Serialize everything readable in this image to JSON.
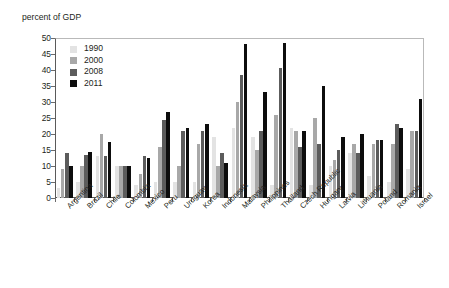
{
  "figure": {
    "title_clipped": "",
    "ylabel": "percent of GDP"
  },
  "legend": {
    "entries": [
      {
        "label": "1990",
        "color": "#e3e3e3"
      },
      {
        "label": "2000",
        "color": "#a8a8a8"
      },
      {
        "label": "2008",
        "color": "#5c5c5c"
      },
      {
        "label": "2011",
        "color": "#0d0d0d"
      }
    ]
  },
  "chart_data": {
    "type": "bar",
    "title": "",
    "xlabel": "",
    "ylabel": "percent of GDP",
    "ylim": [
      0,
      50
    ],
    "ytick_step": 5,
    "yticks": [
      "0",
      "5",
      "10",
      "15",
      "20",
      "25",
      "30",
      "35",
      "40",
      "45",
      "50"
    ],
    "grid": false,
    "legend_position": "top-left",
    "categories": [
      "Argentina",
      "Brazil",
      "Chile",
      "Colombia",
      "Mexico",
      "Peru",
      "Uruguay",
      "Korea",
      "Indonesia",
      "Malaysia",
      "Philippines",
      "Thailand",
      "Czech Republic",
      "Hungary",
      "Latvia",
      "Lithuania",
      "Poland",
      "Romania",
      "Israel"
    ],
    "series": [
      {
        "name": "1990",
        "color": "#e3e3e3",
        "values": [
          3,
          5,
          13,
          10,
          4,
          5,
          5,
          5,
          19,
          22,
          19,
          4,
          22,
          4,
          10,
          14,
          7,
          5,
          9
        ]
      },
      {
        "name": "2000",
        "color": "#a8a8a8",
        "values": [
          9,
          10,
          20,
          10,
          7.5,
          16,
          10,
          17,
          10,
          30,
          15,
          26,
          21,
          25,
          12,
          17,
          17,
          17,
          21
        ]
      },
      {
        "name": "2008",
        "color": "#5c5c5c",
        "values": [
          14,
          13.5,
          13,
          10,
          13,
          24.5,
          21,
          21,
          14,
          38.5,
          21,
          40.5,
          16,
          17,
          15,
          14,
          18,
          23,
          21
        ]
      },
      {
        "name": "2011",
        "color": "#0d0d0d",
        "values": [
          10,
          14.5,
          17.5,
          10,
          12.5,
          27,
          22,
          23,
          11,
          48,
          33,
          48.5,
          21,
          35,
          19,
          20,
          18,
          22,
          31
        ]
      }
    ]
  }
}
